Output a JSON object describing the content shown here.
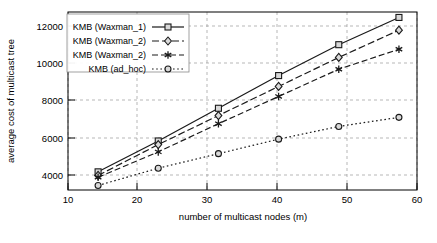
{
  "chart_data": {
    "type": "line",
    "title": "",
    "xlabel": "number of multicast nodes (m)",
    "ylabel": "average cost of multicast tree",
    "x": [
      10,
      20,
      30,
      40,
      50,
      60
    ],
    "xticks": [
      "10",
      "20",
      "30",
      "40",
      "50",
      "60"
    ],
    "yticks": [
      "4000",
      "6000",
      "8000",
      "10000",
      "12000"
    ],
    "xlim": [
      5,
      63
    ],
    "ylim": [
      3000,
      12800
    ],
    "grid": true,
    "legend_position": "upper left inside axes",
    "series": [
      {
        "name": "KMB (Waxman_1)",
        "marker": "square",
        "linestyle": "solid",
        "values": [
          4000,
          5700,
          7500,
          9300,
          11000,
          12500
        ]
      },
      {
        "name": "KMB (Waxman_2)",
        "marker": "diamond",
        "linestyle": "dash-dot",
        "values": [
          3800,
          5500,
          7100,
          8700,
          10300,
          11800
        ]
      },
      {
        "name": "KMB (Waxman_2)",
        "marker": "star",
        "linestyle": "dashed",
        "values": [
          3700,
          5100,
          6650,
          8150,
          9650,
          10750
        ]
      },
      {
        "name": "KMB (ad_hoc)",
        "marker": "circle",
        "linestyle": "dotted",
        "values": [
          3250,
          4200,
          5000,
          5800,
          6500,
          7000
        ]
      }
    ]
  },
  "colors": {
    "line": "#1a1a1a",
    "grid": "#9a9a9a",
    "frame": "#000000",
    "marker_fill": "#d9d9d9",
    "background": "#ffffff"
  }
}
